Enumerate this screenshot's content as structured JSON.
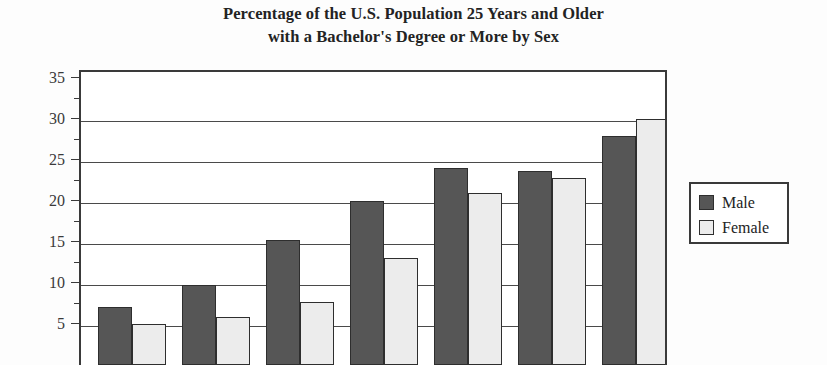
{
  "chart_data": {
    "type": "bar",
    "title": "Percentage of the U.S. Population 25 Years and Older with a Bachelor's Degree or More by Sex",
    "title_line1": "Percentage of the U.S. Population 25 Years and Older",
    "title_line2": "with a Bachelor's Degree or More by Sex",
    "xlabel": "",
    "ylabel": "",
    "ylim": [
      0,
      35
    ],
    "ytick_labels": [
      "35",
      "30",
      "25",
      "20",
      "15",
      "10",
      "5"
    ],
    "ytick_values": [
      35,
      30,
      25,
      20,
      15,
      10,
      5
    ],
    "grid": true,
    "legend_position": "right",
    "categories": [
      "1",
      "2",
      "3",
      "4",
      "5",
      "6",
      "7"
    ],
    "series": [
      {
        "name": "Male",
        "color": "#565656",
        "values": [
          7.1,
          9.7,
          15.2,
          20.0,
          24.0,
          23.7,
          27.9
        ]
      },
      {
        "name": "Female",
        "color": "#ececec",
        "values": [
          5.0,
          5.9,
          7.7,
          13.0,
          21.0,
          22.8,
          30.0
        ]
      }
    ],
    "legend": [
      {
        "label": "Male",
        "swatch": "dark-gray-swatch"
      },
      {
        "label": "Female",
        "swatch": "light-gray-swatch"
      }
    ]
  },
  "colors": {
    "male_bar": "#565656",
    "female_bar": "#ececec",
    "bar_outline": "#2e2e2e",
    "axis": "#3a3a3a",
    "text": "#232323",
    "background": "#fdfdfd"
  }
}
